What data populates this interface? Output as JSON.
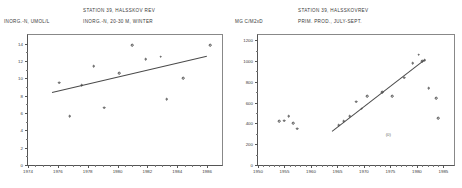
{
  "figure": {
    "panels": [
      {
        "id": "left",
        "station_title": "STATION 39, HALSSKOV REV",
        "series_title": "INORG.-N, 20-30 M, WINTER",
        "ylabel": "INORG.-N, UMOL/L"
      },
      {
        "id": "right",
        "station_title": "STATION 39, HALSSKOVREV",
        "series_title": "PRIM. PROD., JULY-SEPT.",
        "ylabel": "MG C/M2xD"
      }
    ]
  },
  "chart_data": [
    {
      "type": "scatter",
      "title": "STATION 39, HALSSKOV REV",
      "subtitle": "INORG.-N, 20-30 M, WINTER",
      "xlabel": "",
      "ylabel": "INORG.-N, UMOL/L",
      "xlim": [
        1974,
        1987
      ],
      "ylim": [
        0,
        15
      ],
      "xticks": [
        1974,
        1976,
        1978,
        1980,
        1982,
        1984,
        1986
      ],
      "yticks": [
        0,
        2,
        4,
        6,
        8,
        10,
        12,
        14
      ],
      "grid": false,
      "legend": "none",
      "points": [
        {
          "x": 1976.1,
          "y": 9.5
        },
        {
          "x": 1976.8,
          "y": 5.6
        },
        {
          "x": 1977.6,
          "y": 9.2
        },
        {
          "x": 1978.4,
          "y": 11.4
        },
        {
          "x": 1979.1,
          "y": 6.6
        },
        {
          "x": 1980.1,
          "y": 10.6
        },
        {
          "x": 1981.0,
          "y": 13.8
        },
        {
          "x": 1981.9,
          "y": 12.2
        },
        {
          "x": 1982.9,
          "y": 12.5
        },
        {
          "x": 1983.3,
          "y": 7.6
        },
        {
          "x": 1984.4,
          "y": 10.0
        },
        {
          "x": 1986.2,
          "y": 13.8
        }
      ],
      "trendline": {
        "x1": 1975.6,
        "y1": 8.4,
        "x2": 1986.0,
        "y2": 12.6
      }
    },
    {
      "type": "scatter",
      "title": "STATION 39, HALSSKOVREV",
      "subtitle": "PRIM. PROD., JULY-SEPT.",
      "xlabel": "",
      "ylabel": "MG C/M2xD",
      "xlim": [
        1950,
        1987
      ],
      "ylim": [
        0,
        1250
      ],
      "xticks": [
        1950,
        1955,
        1960,
        1965,
        1970,
        1975,
        1980,
        1985
      ],
      "yticks": [
        0,
        200,
        400,
        600,
        800,
        1000,
        1200
      ],
      "grid": false,
      "legend": "none",
      "points": [
        {
          "x": 1954.0,
          "y": 420
        },
        {
          "x": 1955.0,
          "y": 425
        },
        {
          "x": 1955.8,
          "y": 470
        },
        {
          "x": 1956.6,
          "y": 400
        },
        {
          "x": 1957.4,
          "y": 350
        },
        {
          "x": 1965.2,
          "y": 380
        },
        {
          "x": 1966.2,
          "y": 420
        },
        {
          "x": 1967.3,
          "y": 470
        },
        {
          "x": 1968.5,
          "y": 610
        },
        {
          "x": 1969.6,
          "y": 540
        },
        {
          "x": 1970.6,
          "y": 660
        },
        {
          "x": 1973.5,
          "y": 700
        },
        {
          "x": 1975.3,
          "y": 660
        },
        {
          "x": 1977.6,
          "y": 840
        },
        {
          "x": 1979.2,
          "y": 980
        },
        {
          "x": 1980.3,
          "y": 1060
        },
        {
          "x": 1981.0,
          "y": 1000
        },
        {
          "x": 1981.5,
          "y": 1010
        },
        {
          "x": 1982.2,
          "y": 740
        },
        {
          "x": 1983.6,
          "y": 640
        },
        {
          "x": 1984.0,
          "y": 450
        }
      ],
      "annotations": [
        {
          "x": 1974.6,
          "y": 300,
          "text": "(0)"
        }
      ],
      "trendline": {
        "x1": 1964.0,
        "y1": 330,
        "x2": 1981.5,
        "y2": 1020
      }
    }
  ]
}
